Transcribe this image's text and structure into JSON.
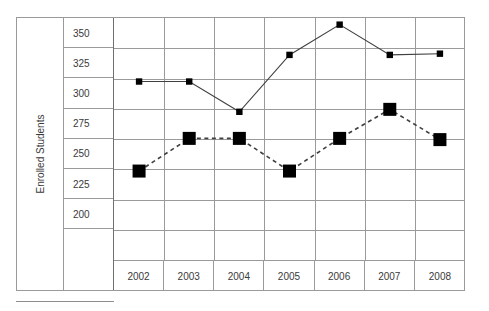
{
  "chart_data": {
    "type": "line",
    "title": "",
    "xlabel": "",
    "ylabel": "Enrolled Students",
    "categories": [
      "2002",
      "2003",
      "2004",
      "2005",
      "2006",
      "2007",
      "2008"
    ],
    "ylim": [
      185,
      365
    ],
    "yticks": [
      350,
      325,
      300,
      275,
      250,
      225,
      200
    ],
    "grid": true,
    "legend": "none-visible",
    "series": [
      {
        "name": "series-solid",
        "line_style": "solid",
        "marker": "square-small",
        "color": "#000000",
        "values": [
          310,
          310,
          285,
          332,
          357,
          332,
          333
        ]
      },
      {
        "name": "series-dashed",
        "line_style": "dashed",
        "marker": "square-large",
        "color": "#000000",
        "values": [
          236,
          263,
          263,
          236,
          263,
          287,
          262
        ]
      }
    ]
  },
  "axis": {
    "y_title": "Enrolled Students",
    "y_tick_labels": [
      "350",
      "325",
      "300",
      "275",
      "250",
      "225",
      "200",
      ""
    ],
    "x_tick_labels": [
      "2002",
      "2003",
      "2004",
      "2005",
      "2006",
      "2007",
      "2008"
    ]
  },
  "colors": {
    "grid": "#9a9a9a",
    "marker": "#000000",
    "line": "#3f3f3f",
    "text": "#3a3a3a",
    "background": "#ffffff"
  }
}
